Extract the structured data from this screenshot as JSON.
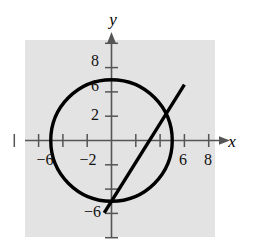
{
  "figure": {
    "title": "",
    "background_color": "#ffffff",
    "plot_background_color": "#e3e3e3",
    "ink_color": "#000000",
    "axis_color": "#555555"
  },
  "axes": {
    "x_axis_label": "x",
    "y_axis_label": "y",
    "x_tick_labels": [
      "−6",
      "−2",
      "6",
      "8"
    ],
    "y_tick_labels": [
      "8",
      "6",
      "2",
      "−6"
    ],
    "x_labeled_values": [
      -6,
      -2,
      6,
      8
    ],
    "y_labeled_values": [
      8,
      6,
      2,
      -6
    ],
    "x_tick_values": [
      -8,
      -6,
      -4,
      -2,
      2,
      4,
      6,
      8
    ],
    "y_tick_values": [
      -8,
      -6,
      -4,
      -2,
      2,
      4,
      6,
      8
    ],
    "x_range": [
      -9.5,
      9.0
    ],
    "y_range": [
      -9.0,
      9.0
    ]
  },
  "chart_data": {
    "type": "line",
    "title": "",
    "xlabel": "x",
    "ylabel": "y",
    "xlim": [
      -9.5,
      9.0
    ],
    "ylim": [
      -9.0,
      9.0
    ],
    "grid": false,
    "legend": "none",
    "series": [
      {
        "name": "circle",
        "kind": "circle",
        "center": [
          0,
          0
        ],
        "radius": 5,
        "equation": "x^2 + y^2 = 25"
      },
      {
        "name": "line",
        "kind": "line",
        "slope": 1.6,
        "intercept": -5,
        "equation": "y = 1.6x - 5",
        "x": [
          -0.6,
          6.0
        ],
        "y": [
          -5.96,
          4.6
        ]
      }
    ],
    "intersections": [
      [
        0.0,
        -5.0
      ],
      [
        4.6,
        2.4
      ]
    ]
  }
}
